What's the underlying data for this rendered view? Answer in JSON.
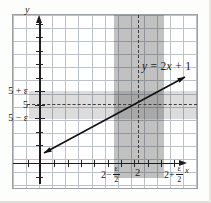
{
  "figure": {
    "equation": {
      "v1": "y",
      "mid": " = 2",
      "v2": "x",
      "end": " + 1"
    },
    "axes": {
      "x_label": "x",
      "y_label": "y"
    },
    "y_tick_labels": [
      "5 + ε",
      "5",
      "5 − ε"
    ],
    "x_tick_labels": {
      "left": {
        "prefix": "2−",
        "num": "ε",
        "den": "2"
      },
      "center": "2",
      "right": {
        "prefix": "2+",
        "num": "ε",
        "den": "2"
      }
    },
    "colors": {
      "h_band": "#d8d8d8",
      "v_band": "#b3b3b3",
      "overlap": "#9a9a9a",
      "grid": "#bcc2c8",
      "axis": "#1c1c1c"
    }
  },
  "chart_data": {
    "type": "line",
    "equation": "y = 2x + 1",
    "series": [
      {
        "name": "y = 2x + 1",
        "slope": 2,
        "intercept": 1
      }
    ],
    "key_point": {
      "x": 2,
      "y": 5
    },
    "y_band": {
      "lower": "5 − ε",
      "upper": "5 + ε"
    },
    "x_band": {
      "lower": "2 − ε/2",
      "upper": "2 + ε/2"
    },
    "dashed_guides": {
      "x": 2,
      "y": 5
    },
    "x_tick_labels": [
      "2 − ε/2",
      "2",
      "2 + ε/2"
    ],
    "y_tick_labels": [
      "5 + ε",
      "5",
      "5 − ε"
    ],
    "axis_labels": {
      "x": "x",
      "y": "y"
    },
    "x_range_drawn": [
      -0.5,
      3.2
    ],
    "grid": true,
    "legend": "none"
  }
}
